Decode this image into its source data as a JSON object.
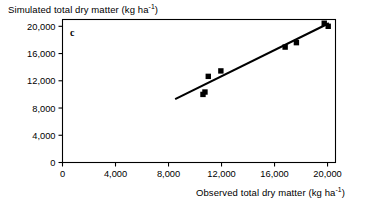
{
  "figure": {
    "panel_label": "c",
    "y_axis_title_main": "Simulated total dry matter (kg ha",
    "y_axis_title_sup": "-1",
    "y_axis_title_tail": ")",
    "x_axis_title_main": "Observed total dry matter (kg ha",
    "x_axis_title_sup": "-1",
    "x_axis_title_tail": ")"
  },
  "chart_data": {
    "type": "scatter",
    "title": "",
    "xlabel": "Observed total dry matter (kg ha-1)",
    "ylabel": "Simulated total dry matter (kg ha-1)",
    "xlim": [
      0,
      20600
    ],
    "ylim": [
      0,
      21000
    ],
    "grid": false,
    "legend": null,
    "xticks": [
      0,
      4000,
      8000,
      12000,
      16000,
      20000
    ],
    "xticklabels": [
      "0",
      "4,000",
      "8,000",
      "12,000",
      "16,000",
      "20,000"
    ],
    "yticks": [
      0,
      4000,
      8000,
      12000,
      16000,
      20000
    ],
    "yticklabels": [
      "0",
      "4,000",
      "8,000",
      "12,000",
      "16,000",
      "20,000"
    ],
    "marker": "filled-square",
    "series": [
      {
        "name": "observed vs simulated total dry matter",
        "points": [
          {
            "x": 10600,
            "y": 10000
          },
          {
            "x": 10750,
            "y": 10350
          },
          {
            "x": 11000,
            "y": 12650
          },
          {
            "x": 11950,
            "y": 13450
          },
          {
            "x": 16800,
            "y": 16950
          },
          {
            "x": 17650,
            "y": 17600
          },
          {
            "x": 19750,
            "y": 20450
          },
          {
            "x": 20050,
            "y": 20000
          }
        ]
      }
    ],
    "fit_line": {
      "type": "linear-regression",
      "x_start": 8500,
      "y_start": 9300,
      "x_end": 20100,
      "y_end": 20450
    }
  }
}
